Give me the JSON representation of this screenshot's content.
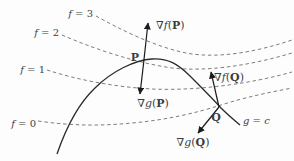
{
  "figure": {
    "colors": {
      "background": "#fdfdfd",
      "dash": "#7d7d7d",
      "curve": "#2a2a2a",
      "arrow": "#1a1a1a",
      "text": "#3d3d3d"
    },
    "curves": [
      {
        "name": "level-curve-f3",
        "dashed": true,
        "path": "M 96,16 C 118,28 152,46 186,53 C 218,59 256,52 292,40"
      },
      {
        "name": "level-curve-f2",
        "dashed": true,
        "path": "M 62,35 C 92,48 132,62 172,68 C 208,72 252,65 292,53"
      },
      {
        "name": "level-curve-f1",
        "dashed": true,
        "path": "M 47,70 C 78,80 115,87 152,89 C 196,91 250,84 292,72"
      },
      {
        "name": "level-curve-f0",
        "dashed": true,
        "path": "M 38,121 C 72,126 102,126 132,123 C 166,120 196,113 221,105 C 246,97 271,92 292,88"
      },
      {
        "name": "constraint-curve-g",
        "dashed": false,
        "path": "M 57,154 C 66,128 78,104 95,88 C 112,71 135,60 152,59 C 168,58 178,64 190,76 C 202,88 212,98 221,108 C 228,115 234,120 240,125"
      }
    ],
    "arrows": [
      {
        "name": "gradient-f-at-P",
        "x1": 143.5,
        "y1": 64,
        "x2": 148,
        "y2": 23
      },
      {
        "name": "gradient-g-at-P",
        "x1": 143.5,
        "y1": 64,
        "x2": 140,
        "y2": 94
      },
      {
        "name": "gradient-f-at-Q",
        "x1": 219,
        "y1": 107,
        "x2": 211,
        "y2": 72
      },
      {
        "name": "gradient-g-at-Q",
        "x1": 219,
        "y1": 107,
        "x2": 198,
        "y2": 133
      }
    ],
    "labels": [
      {
        "name": "label-f3",
        "x": 93,
        "y": 17,
        "anchor": "end",
        "size": 10,
        "parts": [
          {
            "t": "f",
            "i": true
          },
          {
            "t": " = 3"
          }
        ]
      },
      {
        "name": "label-f2",
        "x": 59,
        "y": 36,
        "anchor": "end",
        "size": 10,
        "parts": [
          {
            "t": "f",
            "i": true
          },
          {
            "t": " = 2"
          }
        ]
      },
      {
        "name": "label-f1",
        "x": 45,
        "y": 73,
        "anchor": "end",
        "size": 10,
        "parts": [
          {
            "t": "f",
            "i": true
          },
          {
            "t": " = 1"
          }
        ]
      },
      {
        "name": "label-f0",
        "x": 36,
        "y": 127,
        "anchor": "end",
        "size": 10,
        "parts": [
          {
            "t": "f",
            "i": true
          },
          {
            "t": " = 0"
          }
        ]
      },
      {
        "name": "label-grad-f-P",
        "x": 156,
        "y": 29,
        "anchor": "start",
        "size": 11,
        "parts": [
          {
            "t": "∇"
          },
          {
            "t": "f",
            "i": true
          },
          {
            "t": "("
          },
          {
            "t": "P",
            "b": true
          },
          {
            "t": ")"
          }
        ]
      },
      {
        "name": "label-point-P",
        "x": 139,
        "y": 61,
        "anchor": "end",
        "size": 11,
        "parts": [
          {
            "t": "P",
            "b": true
          }
        ]
      },
      {
        "name": "label-grad-g-P",
        "x": 153,
        "y": 107,
        "anchor": "middle",
        "size": 11,
        "parts": [
          {
            "t": "∇"
          },
          {
            "t": "g",
            "i": true
          },
          {
            "t": "("
          },
          {
            "t": "P",
            "b": true
          },
          {
            "t": ")"
          }
        ]
      },
      {
        "name": "label-grad-f-Q",
        "x": 214,
        "y": 81,
        "anchor": "start",
        "size": 11,
        "parts": [
          {
            "t": "∇"
          },
          {
            "t": "f",
            "i": true
          },
          {
            "t": "("
          },
          {
            "t": "Q",
            "b": true
          },
          {
            "t": ")"
          }
        ]
      },
      {
        "name": "label-point-Q",
        "x": 216,
        "y": 121,
        "anchor": "middle",
        "size": 11,
        "parts": [
          {
            "t": "Q",
            "b": true
          }
        ]
      },
      {
        "name": "label-g-equals-c",
        "x": 243,
        "y": 124,
        "anchor": "start",
        "size": 10,
        "parts": [
          {
            "t": "g",
            "i": true
          },
          {
            "t": " = "
          },
          {
            "t": "c",
            "i": true
          }
        ]
      },
      {
        "name": "label-grad-g-Q",
        "x": 193,
        "y": 146,
        "anchor": "middle",
        "size": 11,
        "parts": [
          {
            "t": "∇"
          },
          {
            "t": "g",
            "i": true
          },
          {
            "t": "("
          },
          {
            "t": "Q",
            "b": true
          },
          {
            "t": ")"
          }
        ]
      }
    ]
  }
}
